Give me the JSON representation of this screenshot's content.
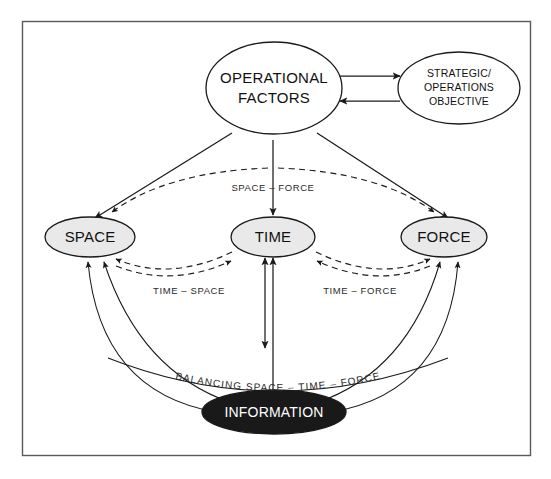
{
  "diagram": {
    "colors": {
      "node_fill_default": "#ffffff",
      "node_fill_gray": "#e9e9e9",
      "node_fill_black": "#191919",
      "stroke": "#1a1a1a",
      "frame": "#5a5a5a",
      "text": "#111111",
      "text_inverse": "#ffffff"
    },
    "nodes": {
      "operational_factors": {
        "line1": "OPERATIONAL",
        "line2": "FACTORS"
      },
      "strategic_objective": {
        "line1": "STRATEGIC/",
        "line2": "OPERATIONS",
        "line3": "OBJECTIVE"
      },
      "space": {
        "label": "SPACE"
      },
      "time": {
        "label": "TIME"
      },
      "force": {
        "label": "FORCE"
      },
      "information": {
        "label": "INFORMATION"
      }
    },
    "edge_labels": {
      "space_force": "SPACE – FORCE",
      "time_space": "TIME – SPACE",
      "time_force": "TIME – FORCE",
      "balancing": "BALANCING SPACE – TIME – FORCE"
    }
  }
}
